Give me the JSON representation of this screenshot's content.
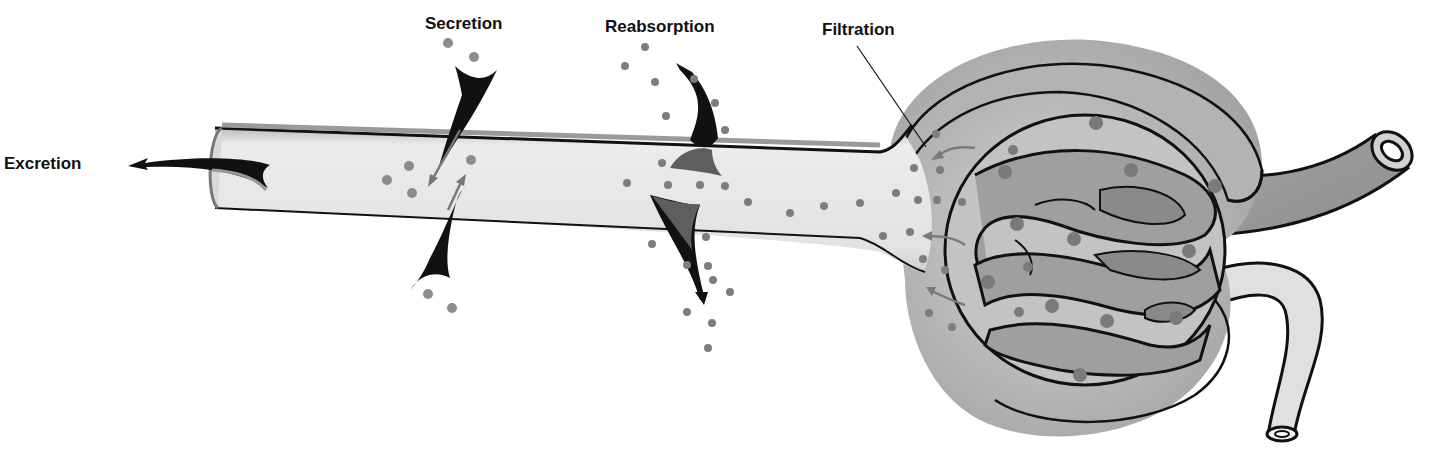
{
  "diagram": {
    "type": "nephron-process-diagram",
    "labels": {
      "excretion": "Excretion",
      "secretion": "Secretion",
      "reabsorption": "Reabsorption",
      "filtration": "Filtration"
    },
    "structures": [
      "renal-tubule",
      "bowmans-capsule",
      "glomerulus",
      "afferent-arteriole",
      "efferent-arteriole"
    ],
    "colors": {
      "background": "#ffffff",
      "tubule_fill": "#e4e4e4",
      "tubule_wall": "#9a9a9a",
      "capsule_outer": "#a8a8a8",
      "capsule_inner": "#cfcfcf",
      "capillary_fill": "#9e9e9e",
      "capillary_dark": "#7a7a7a",
      "particle": "#7d7d7d",
      "arrow": "#111111",
      "outline": "#111111"
    }
  }
}
